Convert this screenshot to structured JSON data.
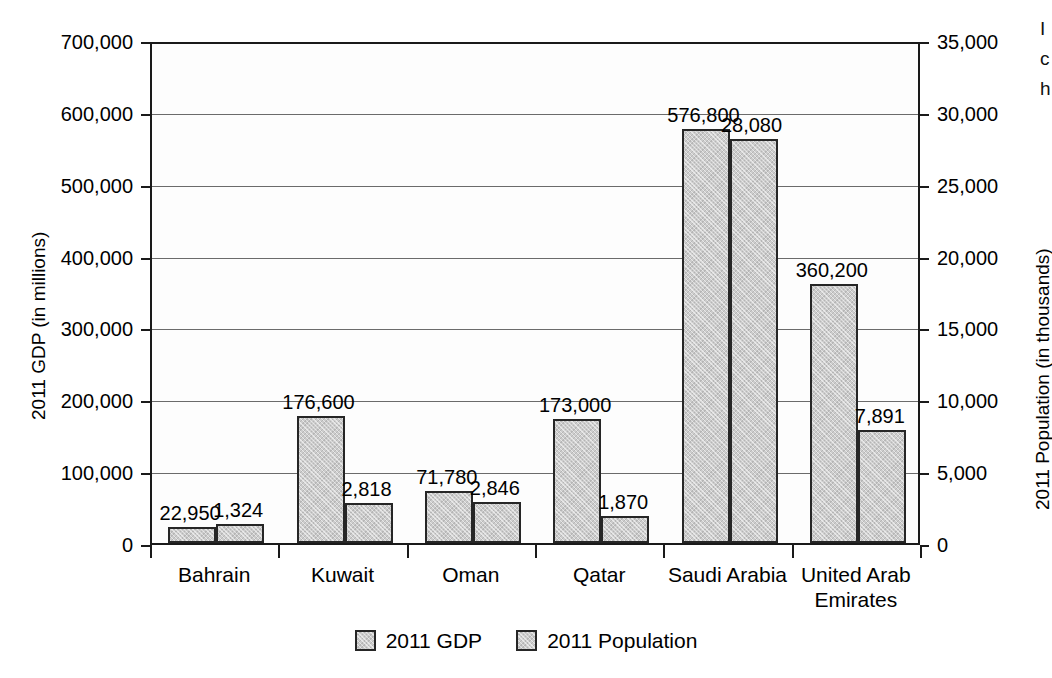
{
  "chart_data": {
    "type": "bar",
    "title": "",
    "subtitle": "",
    "categories": [
      "Bahrain",
      "Kuwait",
      "Oman",
      "Qatar",
      "Saudi Arabia",
      "United Arab\nEmirates"
    ],
    "series": [
      {
        "name": "2011 GDP",
        "axis": "left",
        "unit": "millions",
        "values": [
          22950,
          176600,
          71780,
          173000,
          576800,
          360200
        ],
        "labels": [
          "22,950",
          "176,600",
          "71,780",
          "173,000",
          "576,800",
          "360,200"
        ]
      },
      {
        "name": "2011 Population",
        "axis": "right",
        "unit": "thousands",
        "values": [
          1324,
          2818,
          2846,
          1870,
          28080,
          7891
        ],
        "labels": [
          "1,324",
          "2,818",
          "2,846",
          "1,870",
          "28,080",
          "7,891"
        ]
      }
    ],
    "xlabel": "",
    "ylabel": "2011 GDP (in millions)",
    "ylabel_right": "2011 Population (in thousands)",
    "ylim": [
      0,
      700000
    ],
    "ylim_right": [
      0,
      35000
    ],
    "yticks": [
      0,
      100000,
      200000,
      300000,
      400000,
      500000,
      600000,
      700000
    ],
    "ytick_labels": [
      "0",
      "100,000",
      "200,000",
      "300,000",
      "400,000",
      "500,000",
      "600,000",
      "700,000"
    ],
    "yticks_right": [
      0,
      5000,
      10000,
      15000,
      20000,
      25000,
      30000,
      35000
    ],
    "ytick_labels_right": [
      "0",
      "5,000",
      "10,000",
      "15,000",
      "20,000",
      "25,000",
      "30,000",
      "35,000"
    ],
    "grid": true,
    "legend_position": "bottom",
    "bar_fill_color": "#cccccc",
    "bar_edge_color": "#262626",
    "axis_color": "#1a1a1a",
    "grid_color": "#6b6b6b",
    "background_color": "#ffffff"
  },
  "legend": {
    "items": [
      {
        "label": "2011 GDP"
      },
      {
        "label": "2011 Population"
      }
    ]
  },
  "margin_text": {
    "lines": [
      "I",
      "c",
      "h"
    ]
  }
}
